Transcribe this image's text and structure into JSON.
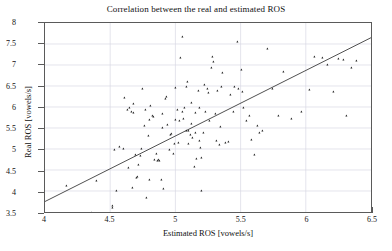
{
  "chart_data": {
    "type": "scatter",
    "title": "Correlation between the real and estimated ROS",
    "xlabel": "Estimated ROS [vowels/s]",
    "ylabel": "Real ROS [vowels/s]",
    "xlim": [
      4,
      6.5
    ],
    "ylim": [
      3.5,
      8
    ],
    "xticks": [
      4,
      4.5,
      5,
      5.5,
      6,
      6.5
    ],
    "xtick_labels": [
      "4",
      "4.5",
      "5",
      "5.5",
      "6",
      "6.5"
    ],
    "yticks": [
      3.5,
      4,
      4.5,
      5,
      5.5,
      6,
      6.5,
      7,
      7.5,
      8
    ],
    "ytick_labels": [
      "3.5",
      "4",
      "4.5",
      "5",
      "5.5",
      "6",
      "6.5",
      "7",
      "7.5",
      "8"
    ],
    "grid": true,
    "legend": null,
    "marker": "triangle",
    "marker_color": "#1b1b1b",
    "fit_line": {
      "label": "linear regression line",
      "color": "#3a3a3a",
      "x": [
        4.0,
        6.5
      ],
      "y": [
        3.75,
        7.65
      ],
      "slope": 1.56,
      "intercept": -2.49
    },
    "series": [
      {
        "name": "speakers",
        "x": [
          4.17,
          4.36,
          4.4,
          4.48,
          4.52,
          4.52,
          4.53,
          4.55,
          4.57,
          4.6,
          4.61,
          4.63,
          4.64,
          4.65,
          4.66,
          4.67,
          4.68,
          4.68,
          4.69,
          4.7,
          4.71,
          4.72,
          4.73,
          4.74,
          4.75,
          4.76,
          4.77,
          4.78,
          4.79,
          4.8,
          4.8,
          4.81,
          4.82,
          4.83,
          4.84,
          4.85,
          4.86,
          4.87,
          4.88,
          4.89,
          4.9,
          4.9,
          4.91,
          4.92,
          4.93,
          4.94,
          4.95,
          4.96,
          4.97,
          4.98,
          4.99,
          5.0,
          5.0,
          5.01,
          5.02,
          5.03,
          5.04,
          5.05,
          5.05,
          5.06,
          5.07,
          5.08,
          5.08,
          5.09,
          5.1,
          5.1,
          5.11,
          5.12,
          5.12,
          5.13,
          5.14,
          5.15,
          5.15,
          5.16,
          5.17,
          5.18,
          5.18,
          5.19,
          5.2,
          5.2,
          5.21,
          5.22,
          5.23,
          5.24,
          5.25,
          5.26,
          5.27,
          5.28,
          5.29,
          5.3,
          5.31,
          5.32,
          5.33,
          5.34,
          5.35,
          5.36,
          5.38,
          5.4,
          5.42,
          5.44,
          5.45,
          5.47,
          5.48,
          5.5,
          5.51,
          5.52,
          5.54,
          5.56,
          5.58,
          5.6,
          5.62,
          5.64,
          5.66,
          5.7,
          5.74,
          5.78,
          5.82,
          5.88,
          5.96,
          6.02,
          6.06,
          6.12,
          6.16,
          6.2,
          6.24,
          6.28,
          6.3,
          6.34,
          6.38
        ],
        "y": [
          4.17,
          3.53,
          4.27,
          3.5,
          3.68,
          3.63,
          5.0,
          4.04,
          5.08,
          5.02,
          6.23,
          5.95,
          4.58,
          6.0,
          5.9,
          4.11,
          5.88,
          6.1,
          4.9,
          4.35,
          4.38,
          4.65,
          4.86,
          5.02,
          6.45,
          5.58,
          5.95,
          3.87,
          5.34,
          4.3,
          5.72,
          6.05,
          5.8,
          5.78,
          4.78,
          4.92,
          4.75,
          4.78,
          4.75,
          4.3,
          5.52,
          5.85,
          4.08,
          6.2,
          6.25,
          5.6,
          5.0,
          5.35,
          5.38,
          4.92,
          5.15,
          5.72,
          6.48,
          5.95,
          5.18,
          5.68,
          7.17,
          5.9,
          7.68,
          5.75,
          6.0,
          5.45,
          6.5,
          6.62,
          5.45,
          5.15,
          5.35,
          5.62,
          6.12,
          5.28,
          4.6,
          5.88,
          5.4,
          4.8,
          6.4,
          5.22,
          6.0,
          5.05,
          4.82,
          4.05,
          5.42,
          6.55,
          5.9,
          6.45,
          6.35,
          5.68,
          6.95,
          7.2,
          7.08,
          5.85,
          5.22,
          6.4,
          5.12,
          5.55,
          6.5,
          6.82,
          5.18,
          5.2,
          6.3,
          5.9,
          6.5,
          7.55,
          6.45,
          6.9,
          6.38,
          6.0,
          5.7,
          5.8,
          5.25,
          4.88,
          5.58,
          5.42,
          5.45,
          7.38,
          6.45,
          5.8,
          6.85,
          5.75,
          5.9,
          6.42,
          7.2,
          7.18,
          7.0,
          6.38,
          7.15,
          7.12,
          5.82,
          6.95,
          7.1
        ]
      }
    ]
  },
  "axes": {
    "box_color": "#5a5a5a",
    "grid_color": "#d8d8e4",
    "tick_font_size": "8px"
  }
}
